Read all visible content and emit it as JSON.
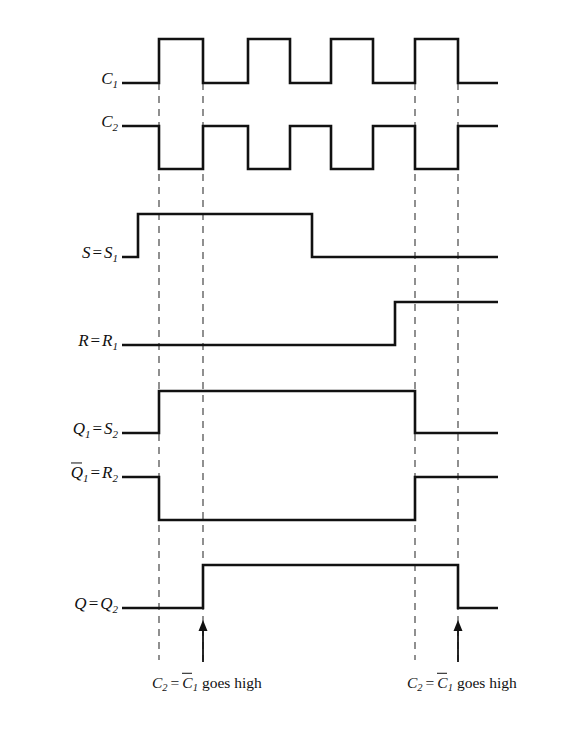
{
  "figure": {
    "kind": "digital-timing-diagram",
    "background_color": "#ffffff",
    "line_color": "#111111",
    "dashed_color": "#555555"
  },
  "signals": [
    {
      "id": "c1",
      "label_html": "C1",
      "label_base": "C",
      "label_sub": "1",
      "row_high_y": 39,
      "row_low_y": 83,
      "transitions": "low until 159, pulses high 159-203, 248-290, 331-373, 415-458, low to end"
    },
    {
      "id": "c2",
      "label_base": "C",
      "label_sub": "2",
      "row_high_y": 126,
      "row_low_y": 169,
      "transitions": "high until 159, low 159-203, high 203-248, low 248-290, high 290-331, low 331-373, high 373-415, low 415-458, high to end"
    },
    {
      "id": "s",
      "label_left": "S",
      "label_eq": "=",
      "label_right_base": "S",
      "label_right_sub": "1",
      "row_high_y": 214,
      "row_low_y": 257,
      "transitions": "low until 138, high 138-312, low to end"
    },
    {
      "id": "r",
      "label_left": "R",
      "label_eq": "=",
      "label_right_base": "R",
      "label_right_sub": "1",
      "row_high_y": 302,
      "row_low_y": 345,
      "transitions": "low until 395, high to end"
    },
    {
      "id": "q1",
      "label_left_base": "Q",
      "label_left_sub": "1",
      "label_eq": "=",
      "label_right_base": "S",
      "label_right_sub": "2",
      "row_high_y": 391,
      "row_low_y": 433,
      "transitions": "low until 159, high 159-415, low to end"
    },
    {
      "id": "q1bar",
      "label_left_base": "Q",
      "label_left_sub": "1",
      "label_left_overline": true,
      "label_eq": "=",
      "label_right_base": "R",
      "label_right_sub": "2",
      "row_high_y": 477,
      "row_low_y": 520,
      "transitions": "high until 159, low 159-415, high to end"
    },
    {
      "id": "q",
      "label_left": "Q",
      "label_eq": "=",
      "label_right_base": "Q",
      "label_right_sub": "2",
      "row_high_y": 565,
      "row_low_y": 608,
      "transitions": "low until 203, high 203-458, low to end"
    }
  ],
  "markers": {
    "dashed_lines_x": [
      159,
      203,
      415,
      458
    ],
    "arrows_x": [
      203,
      458
    ],
    "arrow_top_y": 620,
    "arrow_bottom_y": 662
  },
  "captions": [
    {
      "id": "caption-left",
      "c_base": "C",
      "c_sub": "2",
      "eq": "=",
      "cbar_base": "C",
      "cbar_sub": "1",
      "words": "goes high",
      "center_x": 207,
      "center_y": 684
    },
    {
      "id": "caption-right",
      "c_base": "C",
      "c_sub": "2",
      "eq": "=",
      "cbar_base": "C",
      "cbar_sub": "1",
      "words": "goes high",
      "center_x": 462,
      "center_y": 684
    }
  ],
  "chart_data": {
    "type": "line",
    "title": "",
    "xlabel": "",
    "ylabel": "",
    "grid": false,
    "legend": "none",
    "x_unit": "pixels",
    "xlim": [
      122,
      498
    ],
    "series": [
      {
        "name": "C1",
        "high": 39,
        "low": 83,
        "edges": [
          {
            "x": 122,
            "level": 0
          },
          {
            "x": 159,
            "level": 1
          },
          {
            "x": 203,
            "level": 0
          },
          {
            "x": 248,
            "level": 1
          },
          {
            "x": 290,
            "level": 0
          },
          {
            "x": 331,
            "level": 1
          },
          {
            "x": 373,
            "level": 0
          },
          {
            "x": 415,
            "level": 1
          },
          {
            "x": 458,
            "level": 0
          },
          {
            "x": 498,
            "level": 0
          }
        ]
      },
      {
        "name": "C2",
        "high": 126,
        "low": 169,
        "edges": [
          {
            "x": 122,
            "level": 1
          },
          {
            "x": 159,
            "level": 0
          },
          {
            "x": 203,
            "level": 1
          },
          {
            "x": 248,
            "level": 0
          },
          {
            "x": 290,
            "level": 1
          },
          {
            "x": 331,
            "level": 0
          },
          {
            "x": 373,
            "level": 1
          },
          {
            "x": 415,
            "level": 0
          },
          {
            "x": 458,
            "level": 1
          },
          {
            "x": 498,
            "level": 1
          }
        ]
      },
      {
        "name": "S = S1",
        "high": 214,
        "low": 257,
        "edges": [
          {
            "x": 122,
            "level": 0
          },
          {
            "x": 138,
            "level": 1
          },
          {
            "x": 312,
            "level": 0
          },
          {
            "x": 498,
            "level": 0
          }
        ]
      },
      {
        "name": "R = R1",
        "high": 302,
        "low": 345,
        "edges": [
          {
            "x": 122,
            "level": 0
          },
          {
            "x": 395,
            "level": 1
          },
          {
            "x": 498,
            "level": 1
          }
        ]
      },
      {
        "name": "Q1 = S2",
        "high": 391,
        "low": 433,
        "edges": [
          {
            "x": 122,
            "level": 0
          },
          {
            "x": 159,
            "level": 1
          },
          {
            "x": 415,
            "level": 0
          },
          {
            "x": 498,
            "level": 0
          }
        ]
      },
      {
        "name": "Q1bar = R2",
        "high": 477,
        "low": 520,
        "edges": [
          {
            "x": 122,
            "level": 1
          },
          {
            "x": 159,
            "level": 0
          },
          {
            "x": 415,
            "level": 1
          },
          {
            "x": 498,
            "level": 1
          }
        ]
      },
      {
        "name": "Q = Q2",
        "high": 565,
        "low": 608,
        "edges": [
          {
            "x": 122,
            "level": 0
          },
          {
            "x": 203,
            "level": 1
          },
          {
            "x": 458,
            "level": 0
          },
          {
            "x": 498,
            "level": 0
          }
        ]
      }
    ]
  }
}
